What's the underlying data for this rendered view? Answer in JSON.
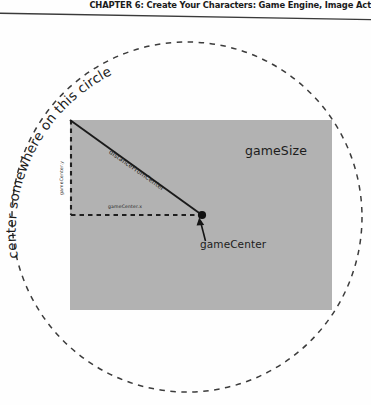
{
  "page": {
    "width": 371,
    "height": 405,
    "background_color": "#fefefe"
  },
  "header": {
    "title": "CHAPTER 6: Create Your Characters: Game Engine, Image Act",
    "rule_color": "#3a3a3a"
  },
  "figure": {
    "name": "game-center-circle-diagram",
    "rect": {
      "label": "gameSize",
      "fill_color": "#b2b2b2",
      "x": 70,
      "y": 100,
      "width": 262,
      "height": 190
    },
    "circle": {
      "label": "center somewhere on this circle",
      "stroke_color": "#3c3c3c",
      "style": "dashed",
      "center_x": 187,
      "center_y": 197,
      "radius": 175
    },
    "point": {
      "label": "gameCenter",
      "x": 202,
      "y": 195,
      "color": "#111111"
    },
    "diagonal": {
      "label": "distanceFromCenter",
      "from_x": 70,
      "from_y": 100,
      "to_x": 202,
      "to_y": 195,
      "color": "#1a1a1a"
    },
    "guides": {
      "horizontal_label": "gameCenter.x",
      "vertical_label": "gameCenter.y",
      "style": "dashed",
      "color": "#1f1f1f"
    },
    "callout_arrow": {
      "name": "gamecenter-arrow",
      "from_x": 200,
      "from_y": 218,
      "to_x": 203,
      "to_y": 198
    }
  }
}
